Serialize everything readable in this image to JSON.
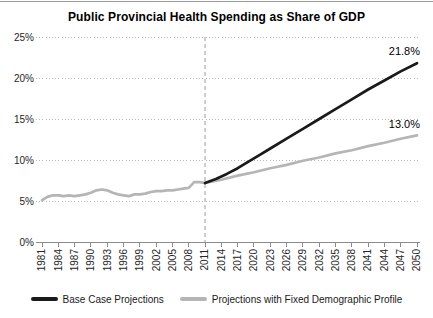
{
  "chart_data": {
    "type": "line",
    "title": "Public Provincial Health Spending as Share of GDP",
    "xlabel": "",
    "ylabel": "",
    "xlim": [
      1981,
      2050
    ],
    "ylim": [
      0,
      25
    ],
    "grid": "horizontal-dotted",
    "legend_position": "bottom",
    "projection_divider_year": 2011,
    "y_ticks": [
      {
        "value": 0,
        "label": "0%"
      },
      {
        "value": 5,
        "label": "5%"
      },
      {
        "value": 10,
        "label": "10%"
      },
      {
        "value": 15,
        "label": "15%"
      },
      {
        "value": 20,
        "label": "20%"
      },
      {
        "value": 25,
        "label": "25%"
      }
    ],
    "x_ticks": [
      1981,
      1984,
      1987,
      1990,
      1993,
      1996,
      1999,
      2002,
      2005,
      2008,
      2011,
      2014,
      2017,
      2020,
      2023,
      2026,
      2029,
      2032,
      2035,
      2038,
      2041,
      2044,
      2047,
      2050
    ],
    "series": [
      {
        "id": "historical",
        "color": "#b5b5b5",
        "points": [
          [
            1981,
            5.1
          ],
          [
            1982,
            5.5
          ],
          [
            1983,
            5.7
          ],
          [
            1984,
            5.7
          ],
          [
            1985,
            5.6
          ],
          [
            1986,
            5.7
          ],
          [
            1987,
            5.6
          ],
          [
            1988,
            5.7
          ],
          [
            1989,
            5.8
          ],
          [
            1990,
            6.0
          ],
          [
            1991,
            6.3
          ],
          [
            1992,
            6.4
          ],
          [
            1993,
            6.3
          ],
          [
            1994,
            6.0
          ],
          [
            1995,
            5.8
          ],
          [
            1996,
            5.7
          ],
          [
            1997,
            5.6
          ],
          [
            1998,
            5.8
          ],
          [
            1999,
            5.8
          ],
          [
            2000,
            5.9
          ],
          [
            2001,
            6.1
          ],
          [
            2002,
            6.2
          ],
          [
            2003,
            6.2
          ],
          [
            2004,
            6.3
          ],
          [
            2005,
            6.3
          ],
          [
            2006,
            6.4
          ],
          [
            2007,
            6.5
          ],
          [
            2008,
            6.6
          ],
          [
            2009,
            7.3
          ],
          [
            2010,
            7.3
          ],
          [
            2011,
            7.2
          ]
        ]
      },
      {
        "id": "fixed-demographic",
        "name": "Projections with Fixed Demographic Profile",
        "color": "#b5b5b5",
        "end_label": "13.0%",
        "points": [
          [
            2011,
            7.2
          ],
          [
            2014,
            7.6
          ],
          [
            2017,
            8.1
          ],
          [
            2020,
            8.5
          ],
          [
            2023,
            9.0
          ],
          [
            2026,
            9.4
          ],
          [
            2029,
            9.9
          ],
          [
            2032,
            10.3
          ],
          [
            2035,
            10.8
          ],
          [
            2038,
            11.2
          ],
          [
            2041,
            11.7
          ],
          [
            2044,
            12.1
          ],
          [
            2047,
            12.6
          ],
          [
            2050,
            13.0
          ]
        ]
      },
      {
        "id": "base-case",
        "name": "Base Case Projections",
        "color": "#1a1a1a",
        "end_label": "21.8%",
        "points": [
          [
            2011,
            7.2
          ],
          [
            2013,
            7.7
          ],
          [
            2015,
            8.3
          ],
          [
            2017,
            9.0
          ],
          [
            2019,
            9.8
          ],
          [
            2021,
            10.6
          ],
          [
            2023,
            11.4
          ],
          [
            2026,
            12.6
          ],
          [
            2029,
            13.8
          ],
          [
            2032,
            15.0
          ],
          [
            2035,
            16.2
          ],
          [
            2038,
            17.4
          ],
          [
            2041,
            18.6
          ],
          [
            2044,
            19.7
          ],
          [
            2047,
            20.8
          ],
          [
            2050,
            21.8
          ]
        ]
      }
    ],
    "legend": [
      {
        "label": "Base Case Projections",
        "color": "#1a1a1a"
      },
      {
        "label": "Projections with Fixed Demographic Profile",
        "color": "#b5b5b5"
      }
    ]
  }
}
